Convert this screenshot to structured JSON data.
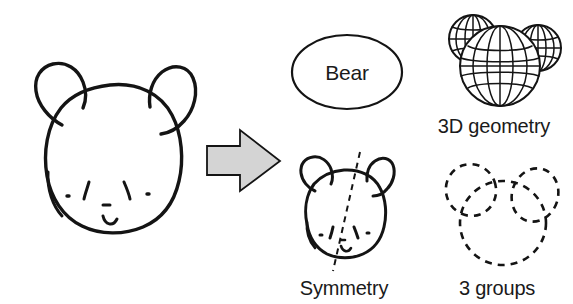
{
  "figure": {
    "background_color": "#ffffff",
    "ink_color": "#141414"
  },
  "source_sketch": {
    "name": "hand-drawn bear head sketch",
    "description": "Hand drawn bear face with two round ears, two eyes, two cheek dots, nose and smiling mouth"
  },
  "arrow": {
    "name": "transformation arrow",
    "direction": "right",
    "fill_color": "#d4d4d4",
    "stroke_color": "#141414"
  },
  "outputs": [
    {
      "id": "semantic",
      "shape": "ellipse",
      "label": "Bear",
      "caption": ""
    },
    {
      "id": "geometry",
      "shape": "wireframe-spheres",
      "label": "",
      "caption": "3D geometry"
    },
    {
      "id": "symmetry",
      "shape": "bear-with-axis",
      "label": "",
      "caption": "Symmetry"
    },
    {
      "id": "grouping",
      "shape": "dashed-ellipses",
      "label": "",
      "caption": "3 groups"
    }
  ],
  "captions": {
    "bear": "Bear",
    "geometry": "3D geometry",
    "symmetry": "Symmetry",
    "groups": "3 groups"
  }
}
